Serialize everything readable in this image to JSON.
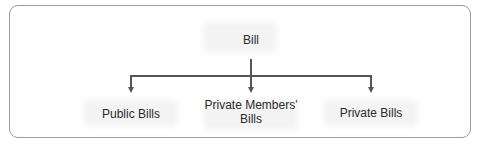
{
  "diagram": {
    "type": "tree",
    "root": {
      "label": "Bill"
    },
    "children": [
      {
        "label": "Public Bills"
      },
      {
        "label": "Private Members' Bills",
        "lines": [
          "Private Members'",
          "Bills"
        ]
      },
      {
        "label": "Private Bills"
      }
    ],
    "colors": {
      "line": "#555555",
      "frame": "#9c9c9c",
      "text": "#2b2b2b"
    }
  }
}
